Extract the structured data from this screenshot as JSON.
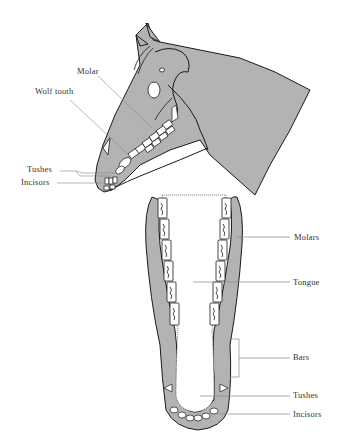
{
  "figure": {
    "colors": {
      "fill": "#b3b3b3",
      "outline": "#1a1a1a",
      "tooth": "#ffffff",
      "leader": "#888888",
      "text": "#333333"
    },
    "side_view": {
      "labels": [
        {
          "id": "molar",
          "text": "Molar"
        },
        {
          "id": "wolf_tooth",
          "text": "Wolf tooth"
        },
        {
          "id": "tushes",
          "text": "Tushes"
        },
        {
          "id": "incisors",
          "text": "Incisors"
        }
      ]
    },
    "jaw_view": {
      "labels": [
        {
          "id": "molars",
          "text": "Molars"
        },
        {
          "id": "tongue",
          "text": "Tongue"
        },
        {
          "id": "bars",
          "text": "Bars"
        },
        {
          "id": "tushes",
          "text": "Tushes"
        },
        {
          "id": "incisors",
          "text": "Incisors"
        }
      ]
    }
  }
}
